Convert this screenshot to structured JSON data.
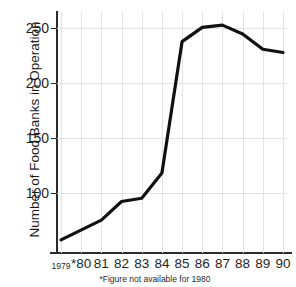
{
  "chart_data": {
    "type": "line",
    "title": "of Food Banks",
    "xlabel": "",
    "ylabel": "Number of Food Banks in Operation",
    "categories": [
      "1979",
      "*80",
      "81",
      "82",
      "83",
      "84",
      "85",
      "86",
      "87",
      "88",
      "89",
      "90"
    ],
    "values": [
      57,
      null,
      75,
      92,
      95,
      118,
      238,
      251,
      253,
      245,
      231,
      228
    ],
    "series": [
      {
        "name": "Food Banks in Operation",
        "values": [
          57,
          null,
          75,
          92,
          95,
          118,
          238,
          251,
          253,
          245,
          231,
          228
        ]
      }
    ],
    "ylim": [
      45,
      265
    ],
    "xlim": [
      0,
      11
    ],
    "yticks": [
      100,
      150,
      200,
      250
    ],
    "ytick_labels": [
      "100",
      "150",
      "200",
      "250"
    ],
    "grid": true,
    "legend": "none",
    "line_color": "#111111",
    "grid_color": "#e2e2e2",
    "axis_color": "#2b2b2b",
    "footnote": "*Figure not available for 1980",
    "annotations": [
      "1980 value missing; line interpolated across gap"
    ]
  },
  "footnote": {
    "text": "*Figure not available for 1980"
  }
}
